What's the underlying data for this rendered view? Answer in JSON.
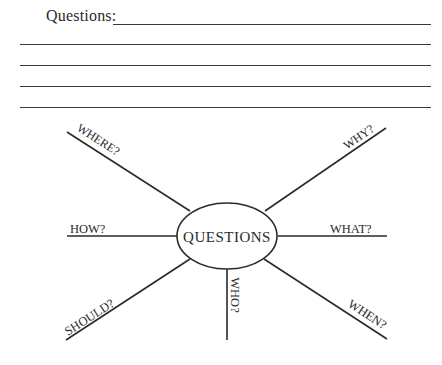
{
  "worksheet": {
    "prompt_label": "Questions:",
    "writing_lines": 5
  },
  "diagram": {
    "center_label": "QUESTIONS",
    "spokes": [
      {
        "label": "WHERE?",
        "position": "upper-left"
      },
      {
        "label": "WHY?",
        "position": "upper-right"
      },
      {
        "label": "HOW?",
        "position": "left"
      },
      {
        "label": "WHAT?",
        "position": "right"
      },
      {
        "label": "SHOULD?",
        "position": "lower-left"
      },
      {
        "label": "WHO?",
        "position": "bottom"
      },
      {
        "label": "WHEN?",
        "position": "lower-right"
      }
    ]
  },
  "colors": {
    "ink": "#2a2a2a",
    "background": "#ffffff"
  }
}
